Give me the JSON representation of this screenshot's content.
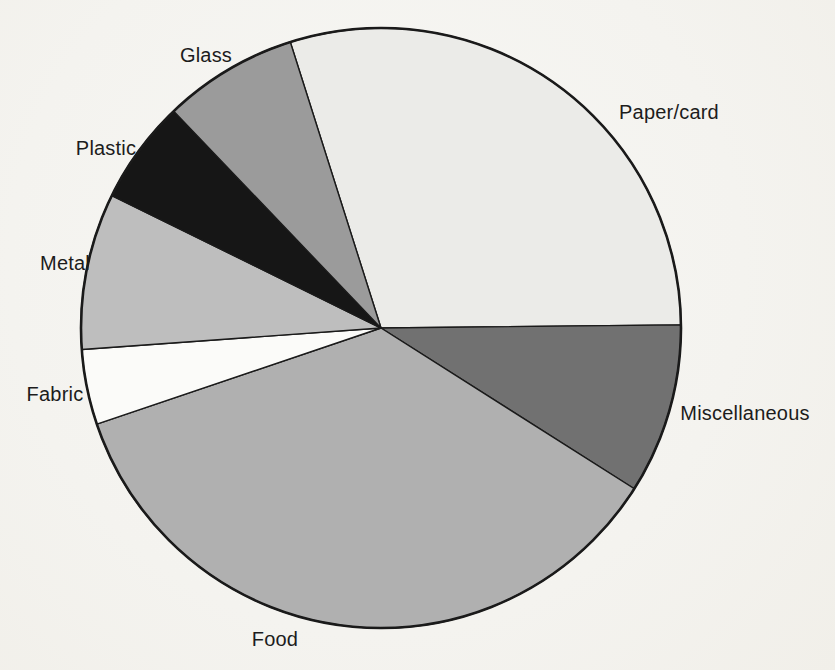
{
  "page": {
    "background_color": "#f4f3ef",
    "ink_color": "#1c1c1c"
  },
  "chart_data": {
    "type": "pie",
    "title": "",
    "legend_position": "labels-around-pie",
    "grid": false,
    "center": {
      "x": 381,
      "y": 328
    },
    "radius": 300,
    "start_angle_deg": 107.6,
    "direction": "clockwise",
    "outline_color": "#1a1a1a",
    "slice_stroke_width": 1.4,
    "rim_stroke_width": 2.6,
    "slices": [
      {
        "label": "Paper/card",
        "percent": 30,
        "degrees": 107.0,
        "color": "#ebebe8"
      },
      {
        "label": "Miscellaneous",
        "percent": 9,
        "degrees": 33.0,
        "color": "#717171"
      },
      {
        "label": "Food",
        "percent": 36,
        "degrees": 128.9,
        "color": "#b0b0b0"
      },
      {
        "label": "Fabric",
        "percent": 4,
        "degrees": 14.6,
        "color": "#fbfbf9"
      },
      {
        "label": "Metal",
        "percent": 8,
        "degrees": 30.3,
        "color": "#bebebe"
      },
      {
        "label": "Plastic",
        "percent": 6,
        "degrees": 20.1,
        "color": "#161616"
      },
      {
        "label": "Glass",
        "percent": 7,
        "degrees": 26.1,
        "color": "#9b9b9b"
      }
    ]
  }
}
